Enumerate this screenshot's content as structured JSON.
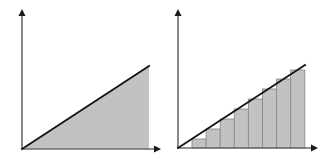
{
  "figure": {
    "width": 327,
    "height": 166,
    "background_color": "#ffffff",
    "panel_count": 2
  },
  "style": {
    "fill_color": "#c2c2c2",
    "bar_fill_color": "#c2c2c2",
    "bar_border_color": "#8a8a8a",
    "axis_color": "#6b6b6b",
    "arrow_color": "#1a1a1a",
    "line_color": "#151515",
    "axis_stroke_width": 1.6,
    "line_stroke_width": 1.9,
    "bar_stroke_width": 0.9
  },
  "panels": [
    {
      "name": "exact-area",
      "offset_x": 0,
      "axes": {
        "origin": [
          22,
          149
        ],
        "y_axis_top": [
          22,
          14
        ],
        "y_axis_arrow_tip": [
          22,
          9
        ],
        "x_axis_right": [
          156,
          149
        ],
        "x_axis_arrow_tip": [
          161,
          149
        ],
        "arrow_half_width": 3.5,
        "arrow_length": 7
      },
      "line": {
        "start": [
          22,
          149
        ],
        "end": [
          149,
          66
        ]
      },
      "region": {
        "shape": "triangle",
        "vertices": [
          [
            22,
            149
          ],
          [
            149,
            66
          ],
          [
            149,
            149
          ]
        ],
        "fill": "#c2c2c2"
      }
    },
    {
      "name": "riemann-approximation",
      "offset_x": 163,
      "axes": {
        "origin": [
          15,
          148
        ],
        "y_axis_top": [
          15,
          14
        ],
        "y_axis_arrow_tip": [
          15,
          9
        ],
        "x_axis_right": [
          150,
          148
        ],
        "x_axis_arrow_tip": [
          155,
          148
        ],
        "arrow_half_width": 3.5,
        "arrow_length": 7
      },
      "line": {
        "start": [
          15,
          148
        ],
        "end": [
          142,
          65
        ]
      },
      "bars": {
        "count": 8,
        "baseline_y": 148,
        "first_left_x": 29,
        "bar_width": 14.1,
        "tops_y": [
          139,
          129,
          119,
          109,
          99,
          89,
          79,
          70
        ],
        "heights": [
          9,
          19,
          29,
          39,
          49,
          59,
          69,
          78
        ],
        "rule": "right-endpoint"
      }
    }
  ]
}
